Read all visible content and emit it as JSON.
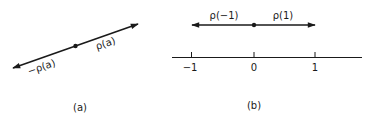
{
  "figure": {
    "panel_a": {
      "caption": "(a)",
      "vector_positive_label": "ρ(a)",
      "vector_negative_label": "−ρ(a)"
    },
    "panel_b": {
      "caption": "(b)",
      "vector_negative_label": "ρ(−1)",
      "vector_positive_label": "ρ(1)",
      "axis": {
        "ticks": [
          "−1",
          "0",
          "1"
        ]
      }
    }
  },
  "colors": {
    "ink": "#1a1a1a",
    "background": "#ffffff"
  }
}
